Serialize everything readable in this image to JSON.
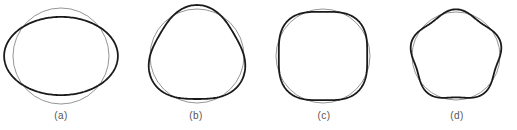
{
  "figure": {
    "reference_color": "#8a8a8a",
    "deformed_color": "#1a1a1a",
    "panels": [
      {
        "id": "a",
        "label": "(a)",
        "mode": 2,
        "cx": 61,
        "cy": 56,
        "r": 48,
        "amp": 0.185,
        "phase_deg": 0,
        "label_x": 61
      },
      {
        "id": "b",
        "label": "(b)",
        "mode": 3,
        "cx": 197,
        "cy": 56,
        "r": 47,
        "amp": 0.085,
        "phase_deg": -90,
        "label_x": 196
      },
      {
        "id": "c",
        "label": "(c)",
        "mode": 4,
        "cx": 323,
        "cy": 56,
        "r": 47,
        "amp": 0.06,
        "phase_deg": 45,
        "label_x": 324
      },
      {
        "id": "d",
        "label": "(d)",
        "mode": 5,
        "cx": 456,
        "cy": 56,
        "r": 44,
        "amp": 0.06,
        "phase_deg": -90,
        "label_x": 457
      }
    ]
  }
}
